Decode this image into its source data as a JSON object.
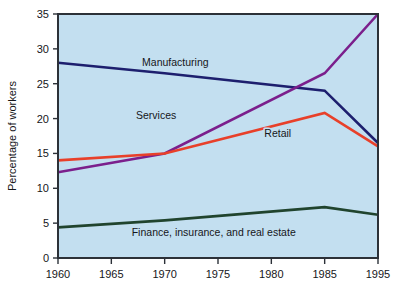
{
  "chart_data": {
    "type": "line",
    "title": "",
    "subtitle": "",
    "xlabel": "",
    "ylabel": "Percentage of workers",
    "x": [
      1960,
      1970,
      1985,
      1995
    ],
    "xtick_labels": [
      "1960",
      "1965",
      "1970",
      "1975",
      "1980",
      "1985",
      "1995"
    ],
    "xtick_values": [
      1960,
      1965,
      1970,
      1975,
      1980,
      1985,
      1995
    ],
    "ytick_labels": [
      "0",
      "5",
      "10",
      "15",
      "20",
      "25",
      "30",
      "35"
    ],
    "ytick_values": [
      0,
      5,
      10,
      15,
      20,
      25,
      30,
      35
    ],
    "ylim": [
      0,
      35
    ],
    "xlim": [
      1960,
      1995
    ],
    "grid": false,
    "legend": "inline-labels",
    "plot_background_color": "#c3dff0",
    "series": [
      {
        "name": "Manufacturing",
        "color": "#1d1f6e",
        "values": [
          28.0,
          26.5,
          24.0,
          16.5
        ],
        "label_x": 1971.0,
        "label_y": 27.6
      },
      {
        "name": "Services",
        "color": "#7b1f8c",
        "values": [
          12.3,
          15.0,
          26.5,
          35.0
        ],
        "label_x": 1969.2,
        "label_y": 20.0
      },
      {
        "name": "Retail",
        "color": "#e8402a",
        "values": [
          14.0,
          15.0,
          20.8,
          16.0
        ],
        "label_x": 1980.6,
        "label_y": 17.3
      },
      {
        "name": "Finance, insurance, and real estate",
        "color": "#20442e",
        "values": [
          4.4,
          5.4,
          7.3,
          6.2
        ],
        "label_x": 1974.6,
        "label_y": 3.1
      }
    ],
    "annotations": [
      "Manufacturing",
      "Services",
      "Retail",
      "Finance, insurance, and real estate"
    ]
  }
}
